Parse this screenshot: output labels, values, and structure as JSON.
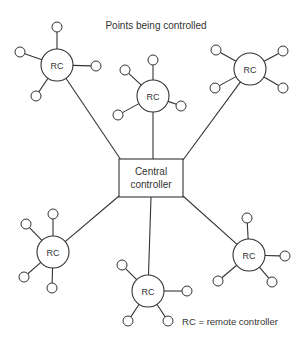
{
  "title": "Points being controlled",
  "central": {
    "line1": "Central",
    "line2": "controller",
    "x": 119,
    "y": 159,
    "w": 64,
    "h": 38
  },
  "legend": "RC = remote controller",
  "remote_label": "RC",
  "remotes": [
    {
      "id": "rc-top-left",
      "label": "RC",
      "cx": 57,
      "cy": 65,
      "r": 16,
      "attach": [
        121,
        160
      ],
      "points": [
        [
          57,
          27
        ],
        [
          20,
          52
        ],
        [
          96,
          66
        ],
        [
          36,
          96
        ]
      ]
    },
    {
      "id": "rc-top-center",
      "label": "RC",
      "cx": 153,
      "cy": 96,
      "r": 16,
      "attach": [
        153,
        159
      ],
      "points": [
        [
          153,
          60
        ],
        [
          125,
          70
        ],
        [
          118,
          115
        ],
        [
          181,
          106
        ]
      ]
    },
    {
      "id": "rc-top-right",
      "label": "RC",
      "cx": 250,
      "cy": 69,
      "r": 16,
      "attach": [
        183,
        160
      ],
      "points": [
        [
          216,
          50
        ],
        [
          283,
          51
        ],
        [
          215,
          88
        ],
        [
          283,
          88
        ]
      ]
    },
    {
      "id": "rc-bottom-left",
      "label": "RC",
      "cx": 53,
      "cy": 252,
      "r": 16,
      "attach": [
        119,
        196
      ],
      "points": [
        [
          53,
          214
        ],
        [
          26,
          224
        ],
        [
          24,
          277
        ],
        [
          52,
          288
        ]
      ]
    },
    {
      "id": "rc-bottom-center",
      "label": "RC",
      "cx": 148,
      "cy": 291,
      "r": 16,
      "attach": [
        151,
        197
      ],
      "points": [
        [
          122,
          265
        ],
        [
          187,
          291
        ],
        [
          128,
          321
        ],
        [
          168,
          321
        ]
      ]
    },
    {
      "id": "rc-bottom-right",
      "label": "RC",
      "cx": 249,
      "cy": 255,
      "r": 16,
      "attach": [
        183,
        196
      ],
      "points": [
        [
          247,
          218
        ],
        [
          285,
          256
        ],
        [
          218,
          281
        ],
        [
          272,
          282
        ]
      ]
    }
  ],
  "point_radius": 5
}
